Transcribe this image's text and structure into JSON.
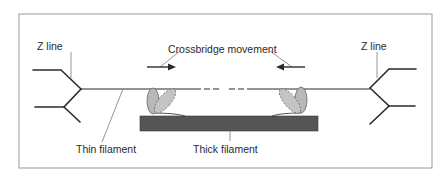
{
  "diagram": {
    "labels": {
      "z_line_left": "Z line",
      "z_line_right": "Z line",
      "crossbridge_movement": "Crossbridge movement",
      "thin_filament": "Thin filament",
      "thick_filament": "Thick filament"
    },
    "arrows": [
      {
        "name": "left-arrow",
        "direction": "right"
      },
      {
        "name": "right-arrow",
        "direction": "left"
      }
    ],
    "colors": {
      "frame": "#9a9a9a",
      "line": "#2b2b2b",
      "thick_filament": "#555555",
      "myosin_head": "#b8b8b8",
      "leader": "#7a7a7a"
    }
  }
}
